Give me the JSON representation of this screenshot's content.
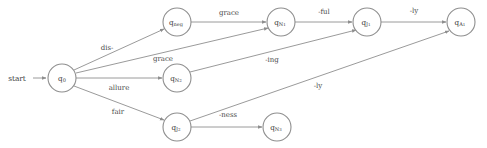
{
  "diagram": {
    "type": "finite-state-automaton",
    "title": "",
    "start_label": "start",
    "colors": {
      "background": "#ffffff",
      "node_stroke": "#8e8e8e",
      "node_fill": "#ffffff",
      "edge_stroke": "#8e8e8e",
      "text": "#3b3b3b"
    },
    "nodes": [
      {
        "id": "q0",
        "base": "q",
        "sub": "0",
        "label": "q0",
        "x": 62,
        "y": 78,
        "r": 14,
        "accepting": false
      },
      {
        "id": "qneg",
        "base": "q",
        "sub": "neg",
        "label": "qneg",
        "x": 177,
        "y": 22,
        "r": 14,
        "accepting": false
      },
      {
        "id": "qN2",
        "base": "q",
        "sub": "N2",
        "label": "qN2",
        "x": 177,
        "y": 78,
        "r": 14,
        "accepting": false
      },
      {
        "id": "qJ2",
        "base": "q",
        "sub": "J2",
        "label": "qJ2",
        "x": 177,
        "y": 127,
        "r": 14,
        "accepting": false
      },
      {
        "id": "qN1",
        "base": "q",
        "sub": "N1",
        "label": "qN1",
        "x": 281,
        "y": 22,
        "r": 14,
        "accepting": false
      },
      {
        "id": "qN3",
        "base": "q",
        "sub": "N3",
        "label": "qN3",
        "x": 277,
        "y": 127,
        "r": 14,
        "accepting": false
      },
      {
        "id": "qJ1",
        "base": "q",
        "sub": "J1",
        "label": "qJ1",
        "x": 367,
        "y": 22,
        "r": 14,
        "accepting": false
      },
      {
        "id": "qA1",
        "base": "q",
        "sub": "A1",
        "label": "qA1",
        "x": 461,
        "y": 22,
        "r": 14,
        "accepting": false
      }
    ],
    "edges": [
      {
        "id": "e-start",
        "from": "start",
        "to": "q0",
        "label": "",
        "lx": 0,
        "ly": 0
      },
      {
        "id": "e-q0-qneg",
        "from": "q0",
        "to": "qneg",
        "label": "dis-",
        "lx": 107,
        "ly": 50
      },
      {
        "id": "e-q0-qN1",
        "from": "q0",
        "to": "qN1",
        "label": "grace",
        "lx": 163,
        "ly": 61
      },
      {
        "id": "e-q0-qN2",
        "from": "q0",
        "to": "qN2",
        "label": "allure",
        "lx": 119,
        "ly": 90
      },
      {
        "id": "e-q0-qJ2",
        "from": "q0",
        "to": "qJ2",
        "label": "fair",
        "lx": 118,
        "ly": 114
      },
      {
        "id": "e-qneg-qN1",
        "from": "qneg",
        "to": "qN1",
        "label": "grace",
        "lx": 229,
        "ly": 15
      },
      {
        "id": "e-qN1-qJ1",
        "from": "qN1",
        "to": "qJ1",
        "label": "-ful",
        "lx": 324,
        "ly": 14
      },
      {
        "id": "e-qN2-qJ1",
        "from": "qN2",
        "to": "qJ1",
        "label": "-ing",
        "lx": 272,
        "ly": 62
      },
      {
        "id": "e-qJ1-qA1",
        "from": "qJ1",
        "to": "qA1",
        "label": "-ly",
        "lx": 414,
        "ly": 13
      },
      {
        "id": "e-qJ2-qN3",
        "from": "qJ2",
        "to": "qN3",
        "label": "-ness",
        "lx": 228,
        "ly": 117
      },
      {
        "id": "e-qJ2-qA1",
        "from": "qJ2",
        "to": "qA1",
        "label": "-ly",
        "lx": 318,
        "ly": 88
      }
    ]
  }
}
